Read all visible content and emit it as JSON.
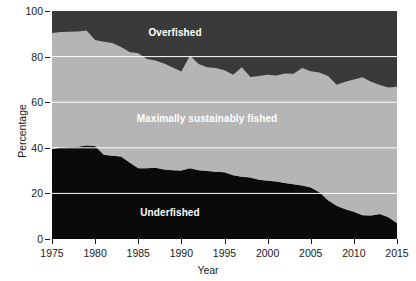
{
  "chart_data": {
    "type": "area",
    "stacked": true,
    "title": "",
    "xlabel": "Year",
    "ylabel": "Percentage",
    "xlim": [
      1975,
      2015
    ],
    "ylim": [
      0,
      100
    ],
    "xticks": [
      1975,
      1980,
      1985,
      1990,
      1995,
      2000,
      2005,
      2010,
      2015
    ],
    "yticks": [
      0,
      20,
      40,
      60,
      80,
      100
    ],
    "grid": "horizontal",
    "gridline_color": "#ffffff",
    "legend_position": "inline-labels",
    "x": [
      1975,
      1976,
      1977,
      1978,
      1979,
      1980,
      1981,
      1982,
      1983,
      1984,
      1985,
      1986,
      1987,
      1988,
      1989,
      1990,
      1991,
      1992,
      1993,
      1994,
      1995,
      1996,
      1997,
      1998,
      1999,
      2000,
      2001,
      2002,
      2003,
      2004,
      2005,
      2006,
      2007,
      2008,
      2009,
      2010,
      2011,
      2012,
      2013,
      2014,
      2015
    ],
    "series": [
      {
        "name": "Underfished",
        "color": "#0a0a0a",
        "values": [
          39.5,
          40.0,
          40.3,
          40.5,
          41.0,
          40.8,
          37.0,
          36.5,
          36.2,
          33.5,
          31.0,
          31.0,
          31.3,
          30.5,
          30.2,
          30.0,
          31.0,
          30.2,
          29.8,
          29.5,
          29.3,
          28.0,
          27.3,
          27.0,
          26.0,
          25.5,
          25.2,
          24.6,
          24.0,
          23.5,
          22.6,
          20.5,
          17.0,
          14.6,
          13.0,
          12.0,
          10.4,
          10.3,
          11.0,
          9.5,
          7.0
        ]
      },
      {
        "name": "Maximally sustainably fished",
        "color": "#b5b5b5",
        "values": [
          50.8,
          50.8,
          50.6,
          50.5,
          50.5,
          46.5,
          49.5,
          49.5,
          48.0,
          48.5,
          50.5,
          48.0,
          47.0,
          46.5,
          45.0,
          43.5,
          49.5,
          46.5,
          45.5,
          45.5,
          44.7,
          44.0,
          48.0,
          44.0,
          45.5,
          46.5,
          46.5,
          48.0,
          48.5,
          51.5,
          51.0,
          52.5,
          54.5,
          53.0,
          56.0,
          58.0,
          60.5,
          58.7,
          56.5,
          57.0,
          59.8
        ]
      },
      {
        "name": "Overfished",
        "color": "#3a3a3a",
        "values": [
          9.7,
          9.2,
          9.1,
          9.0,
          8.5,
          12.7,
          13.5,
          14.0,
          15.8,
          18.0,
          18.5,
          21.0,
          21.7,
          23.0,
          24.8,
          26.5,
          19.5,
          23.3,
          24.7,
          25.0,
          26.0,
          28.0,
          24.7,
          29.0,
          28.5,
          28.0,
          28.3,
          27.4,
          27.5,
          25.0,
          26.4,
          27.0,
          28.5,
          32.4,
          31.0,
          30.0,
          29.1,
          31.0,
          32.5,
          33.5,
          33.2
        ]
      }
    ],
    "inline_labels": [
      {
        "id": "overfished",
        "text": "Overfished",
        "x_px": 175,
        "y_px": 32,
        "color": "#ffffff"
      },
      {
        "id": "maximally",
        "text": "Maximally sustainably fished",
        "x_px": 207,
        "y_px": 118,
        "color": "#ffffff"
      },
      {
        "id": "underfished",
        "text": "Underfished",
        "x_px": 170,
        "y_px": 212,
        "color": "#ffffff"
      }
    ]
  },
  "axes": {
    "y_title": "Percentage",
    "x_title": "Year",
    "y_tick_labels": [
      "0",
      "20",
      "40",
      "60",
      "80",
      "100"
    ],
    "x_tick_labels": [
      "1975",
      "1980",
      "1985",
      "1990",
      "1995",
      "2000",
      "2005",
      "2010",
      "2015"
    ]
  }
}
